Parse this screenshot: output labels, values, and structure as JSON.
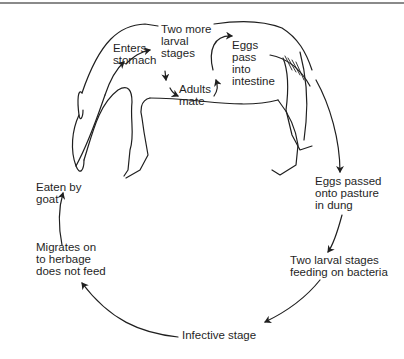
{
  "colors": {
    "line": "#1f1f1f",
    "background": "#ffffff",
    "rule": "#8a8a8a"
  },
  "labels": {
    "enters_stomach": "Enters\nstomach",
    "two_more_larval": "Two more\nlarval\nstages",
    "adults_mate": "Adults\nmate",
    "eggs_pass_intestine": "Eggs\npass\ninto\nintestine",
    "eggs_passed_pasture": "Eggs passed\nonto pasture\nin dung",
    "two_larval_bacteria": "Two larval stages\nfeeding on bacteria",
    "infective_stage": "Infective stage",
    "migrates_herbage": "Migrates on\nto herbage\ndoes not feed",
    "eaten_by_goat": "Eaten by\ngoat"
  },
  "icons": [
    "goat-outline-illustration",
    "cycle-arrows"
  ]
}
